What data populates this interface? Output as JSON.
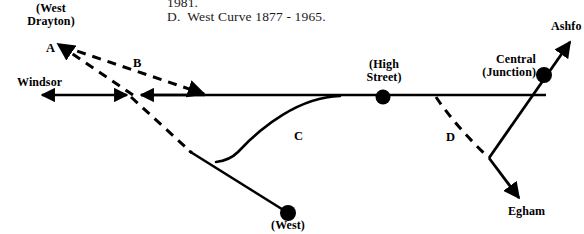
{
  "figure": {
    "kind": "railway-junction-diagram",
    "ink_color": "#000000",
    "background_color": "#ffffff"
  },
  "caption": {
    "line1": "1981.",
    "line2": "D.  West Curve 1877 - 1965."
  },
  "destinations": {
    "west_drayton": "(West\nDrayton)",
    "windsor": "Windsor",
    "ashford": "Ashfo",
    "egham": "Egham"
  },
  "stations": {
    "high_street": "(High\nStreet)",
    "central_junction": "Central\n(Junction)",
    "west": "(West)"
  },
  "curves": {
    "a": "A",
    "b": "B",
    "c": "C",
    "d": "D"
  }
}
